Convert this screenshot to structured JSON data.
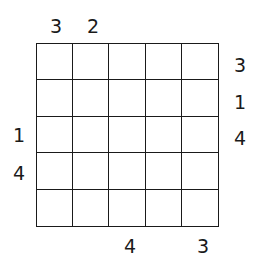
{
  "puzzle": {
    "type": "skyscrapers",
    "size": 5,
    "clues": {
      "top": [
        "3",
        "2",
        "",
        "",
        ""
      ],
      "bottom": [
        "",
        "",
        "4",
        "",
        "3"
      ],
      "left": [
        "",
        "",
        "1",
        "4",
        ""
      ],
      "right": [
        "3",
        "1",
        "4",
        "",
        ""
      ]
    },
    "cells": [
      [
        "",
        "",
        "",
        "",
        ""
      ],
      [
        "",
        "",
        "",
        "",
        ""
      ],
      [
        "",
        "",
        "",
        "",
        ""
      ],
      [
        "",
        "",
        "",
        "",
        ""
      ],
      [
        "",
        "",
        "",
        "",
        ""
      ]
    ]
  }
}
